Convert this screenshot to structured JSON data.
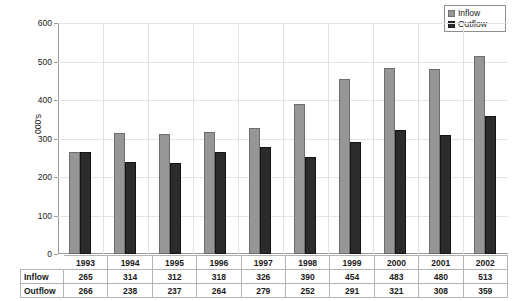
{
  "chart_data": {
    "type": "bar",
    "title": "",
    "xlabel": "",
    "ylabel": "000's",
    "ylim": [
      0,
      600
    ],
    "ytick_step": 100,
    "yticks": [
      600,
      500,
      400,
      300,
      200,
      100,
      0
    ],
    "grid": true,
    "legend_position": "top-right",
    "categories": [
      "1993",
      "1994",
      "1995",
      "1996",
      "1997",
      "1998",
      "1999",
      "2000",
      "2001",
      "2002"
    ],
    "series": [
      {
        "name": "Inflow",
        "color": "#969696",
        "values": [
          265,
          314,
          312,
          318,
          326,
          390,
          454,
          483,
          480,
          513
        ]
      },
      {
        "name": "Outflow",
        "color": "#2b2b2b",
        "values": [
          266,
          238,
          237,
          264,
          279,
          252,
          291,
          321,
          308,
          359
        ]
      }
    ]
  },
  "legend": {
    "items": [
      {
        "label": "Inflow",
        "color": "#969696"
      },
      {
        "label": "Outflow",
        "color": "#2b2b2b"
      }
    ]
  },
  "data_table": {
    "corner": "",
    "columns": [
      "1993",
      "1994",
      "1995",
      "1996",
      "1997",
      "1998",
      "1999",
      "2000",
      "2001",
      "2002"
    ],
    "rows": [
      {
        "label": "Inflow",
        "values": [
          "265",
          "314",
          "312",
          "318",
          "326",
          "390",
          "454",
          "483",
          "480",
          "513"
        ]
      },
      {
        "label": "Outflow",
        "values": [
          "266",
          "238",
          "237",
          "264",
          "279",
          "252",
          "291",
          "321",
          "308",
          "359"
        ]
      }
    ]
  }
}
